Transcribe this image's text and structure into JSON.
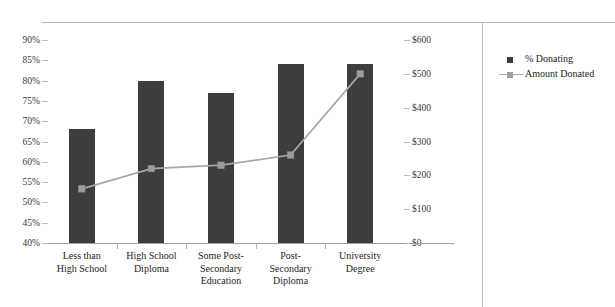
{
  "title": "Chart 1:  Donating and Amount Donated, by Education Level, Canadian Donors, 2013",
  "legend": {
    "position": "right",
    "items": [
      {
        "label": "% Donating",
        "type": "bar",
        "color": "#3d3d3d"
      },
      {
        "label": "Amount Donated",
        "type": "line",
        "color": "#a8a8a8"
      }
    ]
  },
  "axes": {
    "left": {
      "ticks": [
        "90%",
        "85%",
        "80%",
        "75%",
        "70%",
        "65%",
        "60%",
        "55%",
        "50%",
        "45%",
        "40%"
      ],
      "min": 40,
      "max": 90
    },
    "right": {
      "ticks": [
        "$600",
        "$500",
        "$400",
        "$300",
        "$200",
        "$100",
        "$0"
      ],
      "min": 0,
      "max": 600
    }
  },
  "chart_data": {
    "type": "bar",
    "title": "Chart 1:  Donating and Amount Donated, by Education Level, Canadian Donors, 2013",
    "xlabel": "",
    "ylabel": "",
    "grid": false,
    "legend_position": "right",
    "categories": [
      "Less than\nHigh School",
      "High School\nDiploma",
      "Some Post-\nSecondary\nEducation",
      "Post-\nSecondary\nDiploma",
      "University\nDegree"
    ],
    "category_labels": [
      [
        "Less than",
        "High School"
      ],
      [
        "High School",
        "Diploma"
      ],
      [
        "Some Post-",
        "Secondary",
        "Education"
      ],
      [
        "Post-",
        "Secondary",
        "Diploma"
      ],
      [
        "University",
        "Degree"
      ]
    ],
    "series": [
      {
        "name": "% Donating",
        "type": "bar",
        "axis": "left",
        "unit": "%",
        "color": "#3d3d3d",
        "values": [
          68,
          80,
          77,
          84,
          84
        ]
      },
      {
        "name": "Amount Donated",
        "type": "line",
        "axis": "right",
        "unit": "$",
        "color": "#a8a8a8",
        "values": [
          160,
          220,
          230,
          260,
          500
        ]
      }
    ],
    "ylim": [
      40,
      90
    ],
    "y2lim": [
      0,
      600
    ]
  }
}
